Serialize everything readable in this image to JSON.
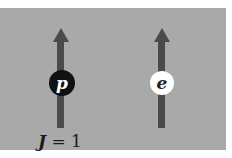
{
  "diagram": {
    "background_color": "#a9a9a9",
    "arrow_color": "#4a4a4a",
    "particles": [
      {
        "symbol": "p",
        "name": "proton",
        "fill": "#111111",
        "text_color": "#ffffff",
        "spin": "up"
      },
      {
        "symbol": "e",
        "name": "electron",
        "fill": "#ffffff",
        "text_color": "#222222",
        "spin": "up"
      }
    ],
    "label": {
      "variable": "J",
      "operator": "=",
      "value": "1"
    }
  }
}
